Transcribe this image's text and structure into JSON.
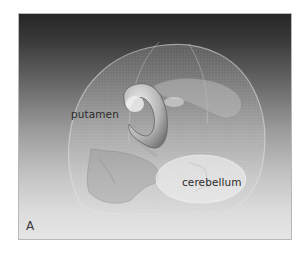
{
  "figure": {
    "panel_label": "A",
    "labels": {
      "putamen": "putamen",
      "cerebellum": "cerebellum"
    },
    "structures": [
      "skull",
      "putamen",
      "cerebellum"
    ],
    "colors": {
      "background_top": "#262626",
      "background_bottom": "#e6e6e6",
      "skull": "#d8d8d8",
      "putamen": "#c8c8c8",
      "cerebellum": "#ececec",
      "label_text": "#2b2b2b"
    }
  }
}
